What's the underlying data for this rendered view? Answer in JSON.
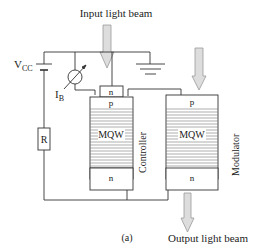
{
  "diagram": {
    "input_label": "Input light beam",
    "output_label": "Output light beam",
    "supply_label": "V",
    "supply_sub": "CC",
    "current_label": "I",
    "current_sub": "B",
    "resistor_label": "R",
    "caption": "(a)",
    "controller": {
      "name": "Controller",
      "top_contact": "n",
      "p_layer": "p",
      "mqw_label": "MQW",
      "n_layer": "n"
    },
    "modulator": {
      "name": "Modulator",
      "p_layer": "p",
      "mqw_label": "MQW",
      "n_layer": "n"
    },
    "colors": {
      "line": "#333333",
      "arrow_fill": "#dddddd",
      "arrow_stroke": "#999999"
    }
  }
}
